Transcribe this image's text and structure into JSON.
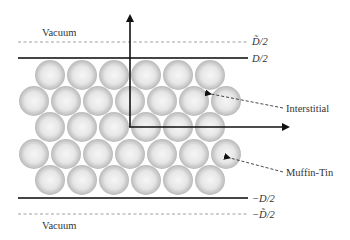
{
  "labels": {
    "vacuum_top": "Vacuum",
    "vacuum_bottom": "Vacuum",
    "d_tilde_half_top": "D̃/2",
    "d_half_top": "D/2",
    "d_half_bottom": "−D/2",
    "d_tilde_half_bottom": "−D̃/2",
    "interstitial": "Interstitial",
    "muffin_tin": "Muffin-Tin"
  },
  "spheres": {
    "radius": 15,
    "rows": [
      {
        "y": 75,
        "x": [
          50,
          82,
          114,
          146,
          178,
          210
        ]
      },
      {
        "y": 101,
        "x": [
          34,
          66,
          98,
          130,
          162,
          194,
          226
        ]
      },
      {
        "y": 127,
        "x": [
          50,
          82,
          114,
          146,
          178,
          210
        ]
      },
      {
        "y": 154,
        "x": [
          34,
          66,
          98,
          130,
          162,
          194,
          226
        ]
      },
      {
        "y": 180,
        "x": [
          50,
          82,
          114,
          146,
          178,
          210
        ]
      }
    ]
  },
  "colors": {
    "line": "#444444",
    "dashed": "#777777",
    "sphere_light": "#f4f4f4",
    "sphere_dark": "#bdbdbd"
  }
}
